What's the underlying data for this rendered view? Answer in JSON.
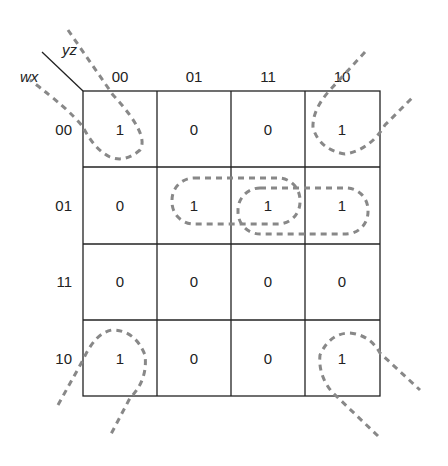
{
  "kmap": {
    "row_variable": "wx",
    "col_variable": "yz",
    "col_labels": [
      "00",
      "01",
      "11",
      "10"
    ],
    "row_labels": [
      "00",
      "01",
      "11",
      "10"
    ],
    "cells": [
      [
        "1",
        "0",
        "0",
        "1"
      ],
      [
        "0",
        "1",
        "1",
        "1"
      ],
      [
        "0",
        "0",
        "0",
        "0"
      ],
      [
        "1",
        "0",
        "0",
        "1"
      ]
    ],
    "groupings": [
      {
        "name": "corners",
        "cells": [
          "00-00",
          "00-10",
          "10-00",
          "10-10"
        ]
      },
      {
        "name": "row01-cols01-11",
        "cells": [
          "01-01",
          "01-11"
        ]
      },
      {
        "name": "row01-cols11-10",
        "cells": [
          "01-11",
          "01-10"
        ]
      }
    ],
    "colors": {
      "grid": "#222222",
      "loop": "#888888"
    }
  }
}
